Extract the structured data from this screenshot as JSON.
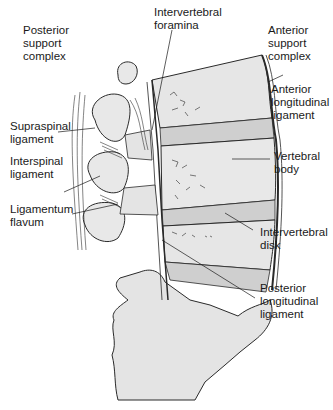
{
  "figure": {
    "type": "anatomical-diagram"
  },
  "labels": {
    "posterior_support_complex": "Posterior\nsupport\ncomplex",
    "intervertebral_foramina": "Intervertebral\nforamina",
    "anterior_support_complex": "Anterior\nsupport\ncomplex",
    "supraspinal_ligament": "Supraspinal\nligament",
    "anterior_longitudinal_ligament": "Anterior\nlongitudinal\nligament",
    "interspinal_ligament": "Interspinal\nligament",
    "vertebral_body": "Vertebral\nbody",
    "ligamentum_flavum": "Ligamentum\nflavum",
    "intervertebral_disk": "Intervertebral\ndisk",
    "posterior_longitudinal_ligament": "Posterior\nlongitudinal\nligament"
  },
  "colors": {
    "bone": "#e4e4e4",
    "disk": "#d0d0d0",
    "outline": "#2a2a2a",
    "text": "#1a1a1a"
  }
}
